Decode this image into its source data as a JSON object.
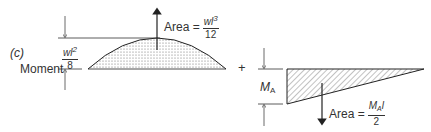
{
  "figure": {
    "panel_label": "(c)",
    "left_diagram": {
      "axis_label": "Moment",
      "height_label": {
        "numerator": "wl",
        "numerator_sup": "2",
        "denominator": "8"
      },
      "area_label": {
        "prefix": "Area =",
        "numerator": "wl",
        "numerator_sup": "3",
        "denominator": "12"
      },
      "shape": "parabola",
      "fill": "stippled"
    },
    "operator": "+",
    "right_diagram": {
      "height_label": {
        "main": "M",
        "sub": "A"
      },
      "area_label": {
        "prefix": "Area =",
        "numerator": "M",
        "numerator_sub": "A",
        "numerator_tail": "l",
        "denominator": "2"
      },
      "shape": "triangle",
      "fill": "hatched"
    }
  }
}
